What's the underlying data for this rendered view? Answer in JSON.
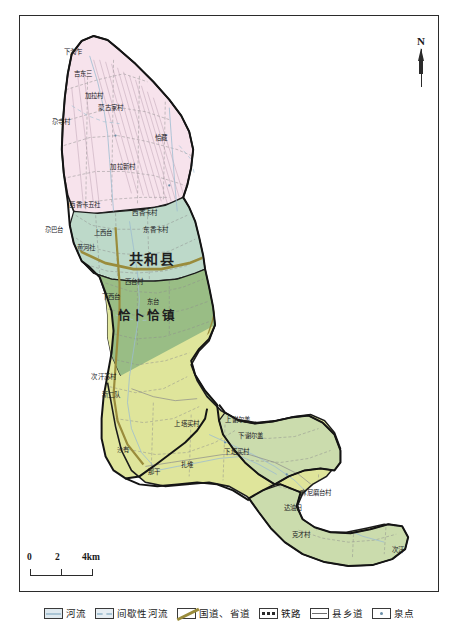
{
  "map": {
    "title_labels": {
      "county": "共和县",
      "town": "恰卜恰镇"
    },
    "north_arrow": {
      "label": "N"
    },
    "scale_bar": {
      "ticks": [
        "0",
        "2",
        "4km"
      ],
      "unit_label": "4km"
    },
    "village_labels": [
      {
        "text": "下淘乍",
        "x": 72,
        "y": 50
      },
      {
        "text": "吉东三",
        "x": 82,
        "y": 72
      },
      {
        "text": "加拉村",
        "x": 93,
        "y": 94
      },
      {
        "text": "蒙古家村",
        "x": 110,
        "y": 106
      },
      {
        "text": "尕寺村",
        "x": 60,
        "y": 120
      },
      {
        "text": "恰藏",
        "x": 160,
        "y": 136
      },
      {
        "text": "加拉新村",
        "x": 122,
        "y": 165
      },
      {
        "text": "西香卡五社",
        "x": 84,
        "y": 203
      },
      {
        "text": "西香卡村",
        "x": 144,
        "y": 211
      },
      {
        "text": "尕巴台",
        "x": 53,
        "y": 228
      },
      {
        "text": "上西台",
        "x": 102,
        "y": 231
      },
      {
        "text": "东香卡村",
        "x": 155,
        "y": 228
      },
      {
        "text": "黄河社",
        "x": 85,
        "y": 246
      },
      {
        "text": "西台村",
        "x": 133,
        "y": 280
      },
      {
        "text": "下西台",
        "x": 110,
        "y": 295
      },
      {
        "text": "东台",
        "x": 152,
        "y": 300
      },
      {
        "text": "次汗苏村",
        "x": 103,
        "y": 375
      },
      {
        "text": "新二队",
        "x": 110,
        "y": 393
      },
      {
        "text": "上塔买村",
        "x": 186,
        "y": 422
      },
      {
        "text": "上谢尔盖",
        "x": 237,
        "y": 418
      },
      {
        "text": "下谢尔盖",
        "x": 250,
        "y": 434
      },
      {
        "text": "沙有",
        "x": 122,
        "y": 448
      },
      {
        "text": "下塔买村",
        "x": 236,
        "y": 450
      },
      {
        "text": "扎堆",
        "x": 186,
        "y": 463
      },
      {
        "text": "那干",
        "x": 153,
        "y": 470
      },
      {
        "text": "麻尼磨台村",
        "x": 315,
        "y": 491
      },
      {
        "text": "达油日",
        "x": 292,
        "y": 506
      },
      {
        "text": "克才村",
        "x": 300,
        "y": 533
      },
      {
        "text": "次汗",
        "x": 397,
        "y": 548
      }
    ]
  },
  "legend": {
    "items": [
      {
        "name": "river",
        "label": "河流"
      },
      {
        "name": "intermittent",
        "label": "间歇性河流"
      },
      {
        "name": "national-road",
        "label": "国道、省道"
      },
      {
        "name": "railway",
        "label": "铁路"
      },
      {
        "name": "county-road",
        "label": "县乡道"
      },
      {
        "name": "spring",
        "label": "泉点"
      }
    ]
  },
  "colors": {
    "region_north": "#f6e2ec",
    "region_middle": "#bcd8c9",
    "region_south_olive": "#dde49a",
    "region_south_green": "#8fb583",
    "region_southeast": "#cbdcad",
    "boundary": "#1c1c1c",
    "road": "#9a8c3c",
    "river": "#8fb0c4"
  }
}
